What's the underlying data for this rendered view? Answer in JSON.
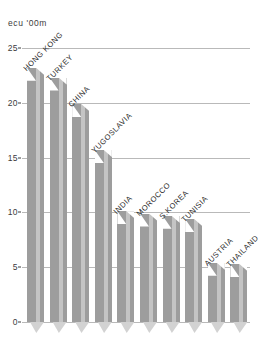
{
  "chart_data": {
    "type": "bar",
    "title": "",
    "subtitle": "",
    "xlabel": "",
    "ylabel": "ecu '00m",
    "ylim": [
      0,
      25
    ],
    "ytick_values": [
      0,
      5,
      10,
      15,
      20,
      25
    ],
    "ytick_labels": [
      "0",
      "5",
      "10",
      "15",
      "20",
      "25"
    ],
    "grid": true,
    "legend": false,
    "categories": [
      "HONG KONG",
      "TURKEY",
      "CHINA",
      "YUGOSLAVIA",
      "INDIA",
      "MOROCCO",
      "S.KOREA",
      "TUNISIA",
      "AUSTRIA",
      "THAILAND"
    ],
    "values": [
      23.2,
      22.3,
      19.9,
      15.7,
      10.1,
      9.9,
      9.7,
      9.4,
      5.4,
      5.3
    ],
    "bar_color": "#9d9d9d",
    "grid_color": "#b9b9b9",
    "text_color": "#262626"
  }
}
